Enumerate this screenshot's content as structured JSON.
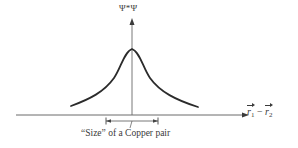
{
  "diagram": {
    "type": "probability-density-plot",
    "y_axis": {
      "label": "Ψ*Ψ"
    },
    "x_axis": {
      "label_parts": [
        {
          "text": "r",
          "sub": "1",
          "vector": true
        },
        {
          "text": " − "
        },
        {
          "text": "r",
          "sub": "2",
          "vector": true
        }
      ],
      "label_plain": "r1 − r2"
    },
    "curve": {
      "shape": "symmetric peaked (Lorentzian-like)",
      "description": "Pair wavefunction probability peaked at zero separation"
    },
    "annotation": {
      "label": "“Size” of a Copper pair",
      "span": "width of central region of the peak"
    },
    "colors": {
      "line": "#2b2b2b",
      "axis": "#555555",
      "text": "#3a3a3a",
      "background": "#ffffff"
    }
  }
}
